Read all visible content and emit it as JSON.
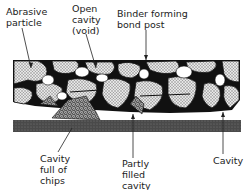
{
  "diagram": {
    "labels": {
      "abrasive_particle": "Abrasive\nparticle",
      "open_cavity": "Open\ncavity\n(void)",
      "binder": "Binder forming\nbond post",
      "cavity_chips": "Cavity\nfull of\nchips",
      "partly_filled": "Partly\nfilled\ncavity",
      "cavity": "Cavity"
    },
    "colors": {
      "ink": "#111111",
      "abrasive_fill": "#cfcfcf",
      "workpiece": "#4a4a4a",
      "background": "#ffffff"
    }
  }
}
